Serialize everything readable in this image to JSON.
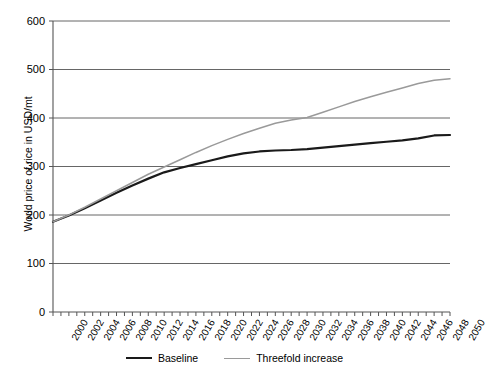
{
  "chart_data": {
    "type": "line",
    "title": "",
    "xlabel": "",
    "ylabel": "World price of rice in USD/mt",
    "ylim": [
      0,
      600
    ],
    "xlim": [
      2000,
      2050
    ],
    "grid": "horizontal",
    "legend_position": "bottom",
    "ytick_labels": [
      "600",
      "500",
      "400",
      "300",
      "200",
      "100",
      "0"
    ],
    "ytick_values": [
      600,
      500,
      400,
      300,
      200,
      100,
      0
    ],
    "categories": [
      2000,
      2002,
      2004,
      2006,
      2008,
      2010,
      2012,
      2014,
      2016,
      2018,
      2020,
      2022,
      2024,
      2026,
      2028,
      2030,
      2032,
      2034,
      2036,
      2038,
      2040,
      2042,
      2044,
      2046,
      2048,
      2050
    ],
    "xtick_labels": [
      "2000",
      "2002",
      "2004",
      "2006",
      "2008",
      "2010",
      "2012",
      "2014",
      "2016",
      "2018",
      "2020",
      "2022",
      "2024",
      "2026",
      "2028",
      "2030",
      "2032",
      "2034",
      "2036",
      "2038",
      "2040",
      "2042",
      "2044",
      "2046",
      "2048",
      "2050"
    ],
    "series": [
      {
        "name": "Baseline",
        "color": "#1a1a1a",
        "x": [
          2000,
          2002,
          2004,
          2006,
          2008,
          2010,
          2012,
          2014,
          2016,
          2018,
          2020,
          2022,
          2024,
          2026,
          2028,
          2030,
          2032,
          2034,
          2036,
          2038,
          2040,
          2042,
          2044,
          2046,
          2048,
          2050
        ],
        "values": [
          186,
          199,
          214,
          230,
          246,
          261,
          275,
          288,
          297,
          305,
          313,
          321,
          327,
          331,
          333,
          334,
          336,
          339,
          342,
          345,
          348,
          351,
          354,
          358,
          364,
          365
        ]
      },
      {
        "name": "Threefold increase",
        "color": "#9a9a9a",
        "x": [
          2000,
          2002,
          2004,
          2006,
          2008,
          2010,
          2012,
          2014,
          2016,
          2018,
          2020,
          2022,
          2024,
          2026,
          2028,
          2030,
          2032,
          2034,
          2036,
          2038,
          2040,
          2042,
          2044,
          2046,
          2048,
          2050
        ],
        "values": [
          186,
          200,
          216,
          233,
          250,
          267,
          284,
          299,
          314,
          329,
          343,
          356,
          368,
          379,
          389,
          396,
          401,
          412,
          423,
          434,
          444,
          453,
          462,
          471,
          478,
          481
        ]
      }
    ]
  },
  "legend": {
    "items": [
      {
        "label": "Baseline"
      },
      {
        "label": "Threefold increase"
      }
    ]
  }
}
